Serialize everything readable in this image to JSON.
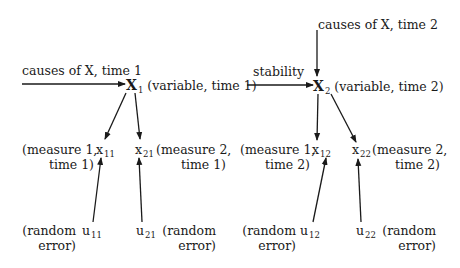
{
  "diagram": {
    "title": "",
    "time1": {
      "causes_label": "causes of X, time 1",
      "variable": {
        "symbol": "X",
        "subscript": "1",
        "label": "(variable, time 1)"
      },
      "measure1": {
        "symbol": "x",
        "subscript": "11",
        "label_line1": "(measure 1,",
        "label_line2": "time 1)"
      },
      "measure2": {
        "symbol": "x",
        "subscript": "21",
        "label_line1": "(measure 2,",
        "label_line2": "time 1)"
      },
      "error1": {
        "symbol": "u",
        "subscript": "11",
        "label_line1": "(random",
        "label_line2": "error)"
      },
      "error2": {
        "symbol": "u",
        "subscript": "21",
        "label_line1": "(random",
        "label_line2": "error)"
      }
    },
    "stability_label": "stability",
    "time2": {
      "causes_label": "causes of X, time 2",
      "variable": {
        "symbol": "X",
        "subscript": "2",
        "label": "(variable, time 2)"
      },
      "measure1": {
        "symbol": "x",
        "subscript": "12",
        "label_line1": "(measure 1,",
        "label_line2": "time 2)"
      },
      "measure2": {
        "symbol": "x",
        "subscript": "22",
        "label_line1": "(measure 2,",
        "label_line2": "time 2)"
      },
      "error1": {
        "symbol": "u",
        "subscript": "12",
        "label_line1": "(random",
        "label_line2": "error)"
      },
      "error2": {
        "symbol": "u",
        "subscript": "22",
        "label_line1": "(random",
        "label_line2": "error)"
      }
    },
    "edges": [
      {
        "from": "causes of X, time 1",
        "to": "X1"
      },
      {
        "from": "X1",
        "to": "x11"
      },
      {
        "from": "X1",
        "to": "x21"
      },
      {
        "from": "u11",
        "to": "x11"
      },
      {
        "from": "u21",
        "to": "x21"
      },
      {
        "from": "X1",
        "to": "X2",
        "label": "stability"
      },
      {
        "from": "causes of X, time 2",
        "to": "X2"
      },
      {
        "from": "X2",
        "to": "x12"
      },
      {
        "from": "X2",
        "to": "x22"
      },
      {
        "from": "u12",
        "to": "x12"
      },
      {
        "from": "u22",
        "to": "x22"
      }
    ],
    "line_color": "#1a1a1a"
  }
}
